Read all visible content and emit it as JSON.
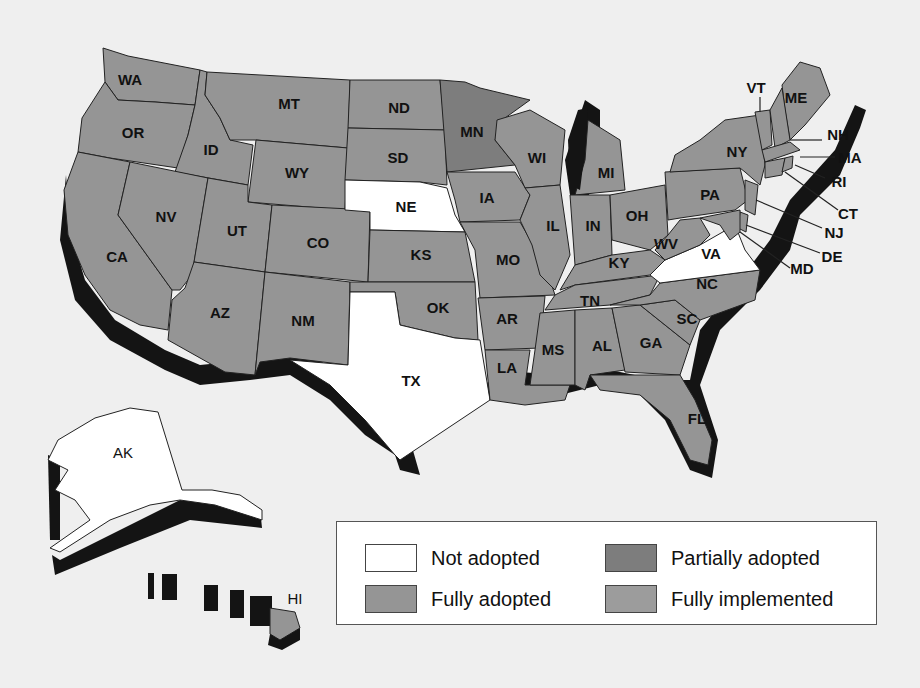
{
  "colors": {
    "background": "#efefef",
    "not_adopted": "#ffffff",
    "partially_adopted": "#7d7d7d",
    "fully_adopted": "#959595",
    "fully_implemented": "#9c9c9c",
    "shadow": "#141414",
    "border": "#222222"
  },
  "legend": {
    "items": [
      {
        "label": "Not adopted",
        "color": "#ffffff"
      },
      {
        "label": "Partially adopted",
        "color": "#7d7d7d"
      },
      {
        "label": "Fully adopted",
        "color": "#959595"
      },
      {
        "label": "Fully implemented",
        "color": "#9c9c9c"
      }
    ]
  },
  "states": {
    "WA": {
      "label": "WA",
      "status": "Fully adopted"
    },
    "OR": {
      "label": "OR",
      "status": "Fully adopted"
    },
    "CA": {
      "label": "CA",
      "status": "Fully adopted"
    },
    "ID": {
      "label": "ID",
      "status": "Fully adopted"
    },
    "NV": {
      "label": "NV",
      "status": "Fully adopted"
    },
    "MT": {
      "label": "MT",
      "status": "Fully adopted"
    },
    "WY": {
      "label": "WY",
      "status": "Fully adopted"
    },
    "UT": {
      "label": "UT",
      "status": "Fully adopted"
    },
    "AZ": {
      "label": "AZ",
      "status": "Fully adopted"
    },
    "CO": {
      "label": "CO",
      "status": "Fully adopted"
    },
    "NM": {
      "label": "NM",
      "status": "Fully adopted"
    },
    "ND": {
      "label": "ND",
      "status": "Fully adopted"
    },
    "SD": {
      "label": "SD",
      "status": "Fully adopted"
    },
    "NE": {
      "label": "NE",
      "status": "Not adopted"
    },
    "KS": {
      "label": "KS",
      "status": "Fully adopted"
    },
    "OK": {
      "label": "OK",
      "status": "Fully adopted"
    },
    "TX": {
      "label": "TX",
      "status": "Not adopted"
    },
    "MN": {
      "label": "MN",
      "status": "Partially adopted"
    },
    "IA": {
      "label": "IA",
      "status": "Fully adopted"
    },
    "MO": {
      "label": "MO",
      "status": "Fully adopted"
    },
    "AR": {
      "label": "AR",
      "status": "Fully adopted"
    },
    "LA": {
      "label": "LA",
      "status": "Fully adopted"
    },
    "WI": {
      "label": "WI",
      "status": "Fully adopted"
    },
    "IL": {
      "label": "IL",
      "status": "Fully adopted"
    },
    "MI": {
      "label": "MI",
      "status": "Fully adopted"
    },
    "IN": {
      "label": "IN",
      "status": "Fully adopted"
    },
    "OH": {
      "label": "OH",
      "status": "Fully adopted"
    },
    "KY": {
      "label": "KY",
      "status": "Fully adopted"
    },
    "TN": {
      "label": "TN",
      "status": "Fully adopted"
    },
    "MS": {
      "label": "MS",
      "status": "Fully adopted"
    },
    "AL": {
      "label": "AL",
      "status": "Fully adopted"
    },
    "GA": {
      "label": "GA",
      "status": "Fully adopted"
    },
    "FL": {
      "label": "FL",
      "status": "Fully adopted"
    },
    "SC": {
      "label": "SC",
      "status": "Fully adopted"
    },
    "NC": {
      "label": "NC",
      "status": "Fully adopted"
    },
    "VA": {
      "label": "VA",
      "status": "Not adopted"
    },
    "WV": {
      "label": "WV",
      "status": "Fully adopted"
    },
    "PA": {
      "label": "PA",
      "status": "Fully adopted"
    },
    "NY": {
      "label": "NY",
      "status": "Fully adopted"
    },
    "VT": {
      "label": "VT",
      "status": "Fully adopted"
    },
    "ME": {
      "label": "ME",
      "status": "Fully adopted"
    },
    "NH": {
      "label": "NH",
      "status": "Fully adopted"
    },
    "MA": {
      "label": "MA",
      "status": "Fully adopted"
    },
    "RI": {
      "label": "RI",
      "status": "Fully adopted"
    },
    "CT": {
      "label": "CT",
      "status": "Fully adopted"
    },
    "NJ": {
      "label": "NJ",
      "status": "Fully adopted"
    },
    "DE": {
      "label": "DE",
      "status": "Fully adopted"
    },
    "MD": {
      "label": "MD",
      "status": "Fully adopted"
    },
    "AK": {
      "label": "AK",
      "status": "Not adopted"
    },
    "HI": {
      "label": "HI",
      "status": "Fully adopted"
    }
  }
}
